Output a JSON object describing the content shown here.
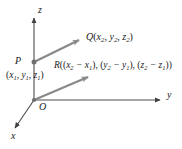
{
  "figure": {
    "background_color": "#ffffff",
    "ink_color": "#1a1a1a",
    "vector_color": "#8a8a8a",
    "axis_color": "#4d4d4d"
  },
  "axes": {
    "z_label": "z",
    "y_label": "y",
    "x_label": "x",
    "origin_label": "O"
  },
  "points": {
    "P": {
      "label": "P",
      "coordinates_text": "(x1, y1, z1)",
      "coord_parts": {
        "x": "x",
        "xsub": "1",
        "y": "y",
        "ysub": "1",
        "z": "z",
        "zsub": "1"
      }
    },
    "Q": {
      "label": "Q",
      "coordinates_text": "(x2, y2, z2)",
      "coord_parts": {
        "x": "x",
        "xsub": "2",
        "y": "y",
        "ysub": "2",
        "z": "z",
        "zsub": "2"
      }
    },
    "R": {
      "label": "R",
      "coordinates_text": "((x2 - x1), (y2 - y1), (z2 - z1))",
      "minus": "−"
    }
  },
  "vectors": [
    {
      "name": "PQ",
      "from": "P",
      "to": "Q",
      "style": "arrow"
    },
    {
      "name": "OR",
      "from": "O",
      "to": "R",
      "style": "arrow"
    }
  ]
}
